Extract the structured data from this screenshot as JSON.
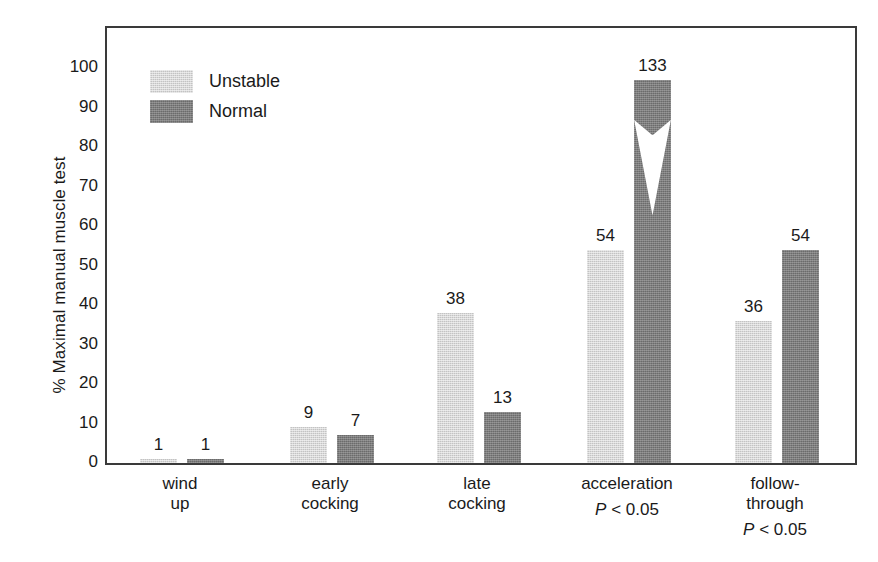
{
  "chart_data": {
    "type": "bar",
    "title": "",
    "subtitle": "",
    "xlabel": "",
    "ylabel": "% Maximal manual muscle test",
    "ylim": [
      0,
      100
    ],
    "yticks": [
      0,
      10,
      20,
      30,
      40,
      50,
      60,
      70,
      80,
      90,
      100
    ],
    "ytick_labels": [
      "0",
      "10",
      "20",
      "30",
      "40",
      "50",
      "60",
      "70",
      "80",
      "90",
      "100"
    ],
    "grid": false,
    "legend_position": "upper-left-inside",
    "categories": [
      "wind up",
      "early cocking",
      "late cocking",
      "acceleration",
      "follow-through"
    ],
    "category_lines": [
      [
        "wind",
        "up"
      ],
      [
        "early",
        "cocking"
      ],
      [
        "late",
        "cocking"
      ],
      [
        "acceleration"
      ],
      [
        "follow-",
        "through"
      ]
    ],
    "category_annotations": [
      "",
      "",
      "",
      "P < 0.05",
      "P < 0.05"
    ],
    "series": [
      {
        "name": "Unstable",
        "color": "#c3c3c3",
        "values": [
          1,
          9,
          38,
          54,
          36
        ],
        "labels": [
          "1",
          "9",
          "38",
          "54",
          "36"
        ]
      },
      {
        "name": "Normal",
        "color": "#6b6b6b",
        "values": [
          1,
          7,
          13,
          133,
          54
        ],
        "labels": [
          "1",
          "7",
          "13",
          "133",
          "54"
        ]
      }
    ],
    "axis_break": {
      "series": "Normal",
      "category": "acceleration",
      "note": "bar value 133 exceeds axis maximum; bar drawn with a chevron break near 85",
      "drawn_top_percent": 97,
      "break_low_percent": 83,
      "break_high_percent": 87
    }
  },
  "legend": {
    "items": [
      {
        "label": "Unstable",
        "swatch": "unstable-swatch"
      },
      {
        "label": "Normal",
        "swatch": "normal-swatch"
      }
    ]
  },
  "colors": {
    "unstable": "#c3c3c3",
    "normal": "#6b6b6b",
    "axis": "#3a3a3a",
    "text": "#1a1a1a",
    "background": "#ffffff"
  }
}
